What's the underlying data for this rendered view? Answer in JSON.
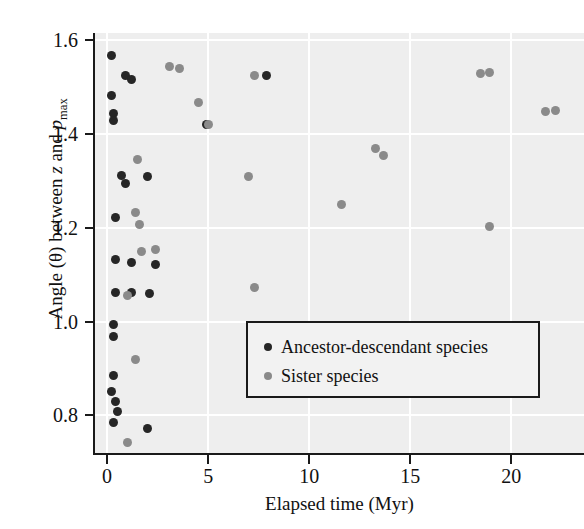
{
  "chart_data": {
    "type": "scatter",
    "title": "",
    "xlabel": "Elapsed time (Myr)",
    "ylabel": "Angle (θ) between z and p_max",
    "xlim": [
      -0.6,
      23.6
    ],
    "ylim": [
      0.72,
      1.615
    ],
    "xticks": [
      0,
      5,
      10,
      15,
      20
    ],
    "xticklabels": [
      "0",
      "5",
      "10",
      "15",
      "20"
    ],
    "yticks": [
      0.8,
      1.0,
      1.2,
      1.4,
      1.6
    ],
    "yticklabels": [
      "0.8",
      "1.0",
      "1.2",
      "1.4",
      "1.6"
    ],
    "grid": true,
    "grid_color": "#ffffff",
    "plot_background": "#eeeeee",
    "legend_position": "lower right",
    "series": [
      {
        "name": "Ancestor-descendant species",
        "color": "#262626",
        "points": [
          [
            0.2,
            1.566
          ],
          [
            0.9,
            1.524
          ],
          [
            1.2,
            1.515
          ],
          [
            0.2,
            1.482
          ],
          [
            0.3,
            1.444
          ],
          [
            0.3,
            1.428
          ],
          [
            7.9,
            1.524
          ],
          [
            4.9,
            1.421
          ],
          [
            0.7,
            1.311
          ],
          [
            0.9,
            1.294
          ],
          [
            2.0,
            1.31
          ],
          [
            0.4,
            1.221
          ],
          [
            0.4,
            1.132
          ],
          [
            1.2,
            1.127
          ],
          [
            2.4,
            1.122
          ],
          [
            0.4,
            1.061
          ],
          [
            1.2,
            1.061
          ],
          [
            2.1,
            1.06
          ],
          [
            0.3,
            0.994
          ],
          [
            0.3,
            0.968
          ],
          [
            0.3,
            0.885
          ],
          [
            0.2,
            0.851
          ],
          [
            0.4,
            0.83
          ],
          [
            0.5,
            0.809
          ],
          [
            0.3,
            0.786
          ],
          [
            2.0,
            0.773
          ]
        ]
      },
      {
        "name": "Sister species",
        "color": "#8a8a8a",
        "points": [
          [
            3.1,
            1.544
          ],
          [
            3.6,
            1.54
          ],
          [
            18.5,
            1.528
          ],
          [
            18.9,
            1.531
          ],
          [
            4.5,
            1.467
          ],
          [
            7.3,
            1.525
          ],
          [
            21.7,
            1.447
          ],
          [
            22.2,
            1.45
          ],
          [
            5.0,
            1.421
          ],
          [
            1.5,
            1.345
          ],
          [
            13.3,
            1.368
          ],
          [
            13.7,
            1.355
          ],
          [
            18.9,
            1.203
          ],
          [
            1.4,
            1.233
          ],
          [
            1.6,
            1.206
          ],
          [
            7.0,
            1.31
          ],
          [
            11.6,
            1.249
          ],
          [
            1.7,
            1.15
          ],
          [
            2.4,
            1.154
          ],
          [
            7.3,
            1.072
          ],
          [
            1.0,
            1.056
          ],
          [
            1.4,
            0.919
          ],
          [
            1.0,
            0.742
          ]
        ]
      }
    ]
  },
  "legend": {
    "items": [
      {
        "label": "Ancestor-descendant species"
      },
      {
        "label": "Sister species"
      }
    ]
  },
  "axes": {
    "x_title": "Elapsed time (Myr)",
    "y_title_part1": "Angle (θ) between ",
    "y_title_z": "z",
    "y_title_and": " and ",
    "y_title_p": "p",
    "y_title_pmax_sub": "max"
  }
}
